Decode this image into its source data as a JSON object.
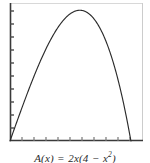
{
  "figure": {
    "caption_prefix": "A(x)",
    "caption_equals": "=",
    "caption_coef": "2x(4",
    "caption_minus": "−",
    "caption_var": "x",
    "caption_exp": "2",
    "caption_close": ")",
    "caption_full": "A(x) = 2x(4 − x²)"
  },
  "colors": {
    "background": "#ffffff",
    "axis_dark": "#3a3a3a",
    "axis_light": "#d8d8d8",
    "curve": "#2a2a2a",
    "tick": "#555555",
    "caption_text": "#2b2b2b"
  },
  "chart_data": {
    "type": "line",
    "title": "",
    "xlabel": "",
    "ylabel": "",
    "equation": "A(x) = 2x(4 − x²)",
    "xlim": [
      0,
      2.2
    ],
    "ylim": [
      0,
      6.5
    ],
    "grid": false,
    "legend": null,
    "x_ticks": [
      0,
      0.2,
      0.4,
      0.6,
      0.8,
      1.0,
      1.2,
      1.4,
      1.6,
      1.8,
      2.0
    ],
    "y_ticks": [
      0,
      0.6,
      1.2,
      1.8,
      2.4,
      3.0,
      3.6,
      4.2,
      4.8,
      5.4,
      6.0
    ],
    "x_tick_labels": [],
    "y_tick_labels": [],
    "series": [
      {
        "name": "A(x) = 2x(4 - x^2)",
        "x": [
          0.0,
          0.1,
          0.2,
          0.3,
          0.4,
          0.5,
          0.6,
          0.7,
          0.8,
          0.9,
          1.0,
          1.1,
          1.2,
          1.3,
          1.4,
          1.5,
          1.6,
          1.7,
          1.8,
          1.9,
          2.0
        ],
        "y": [
          0.0,
          0.798,
          1.584,
          2.346,
          3.072,
          3.75,
          4.368,
          4.914,
          5.376,
          5.742,
          6.0,
          6.138,
          6.144,
          6.006,
          5.712,
          5.25,
          4.608,
          3.774,
          2.736,
          1.482,
          0.0
        ]
      }
    ],
    "peak": {
      "x": 1.1547,
      "y": 6.1584
    },
    "roots": [
      0.0,
      2.0
    ]
  }
}
